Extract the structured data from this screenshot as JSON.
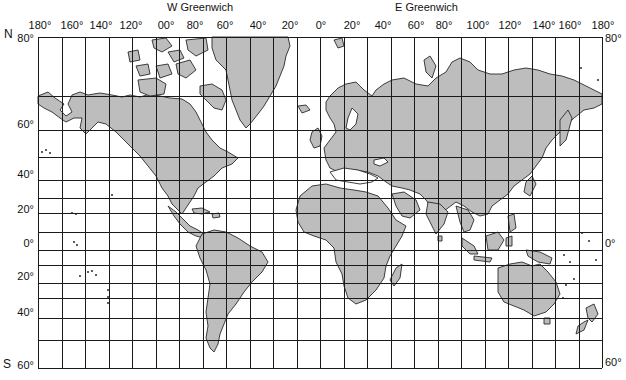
{
  "hemisphere_labels": {
    "west": "W Greenwich",
    "east": "E Greenwich"
  },
  "pole_labels": {
    "north": "N",
    "south": "S"
  },
  "longitude_labels_top": [
    {
      "text": "180°",
      "x": 40
    },
    {
      "text": "160°",
      "x": 72
    },
    {
      "text": "140°",
      "x": 101
    },
    {
      "text": "120°",
      "x": 131
    },
    {
      "text": "00°",
      "x": 166
    },
    {
      "text": "80°",
      "x": 195
    },
    {
      "text": "60°",
      "x": 225
    },
    {
      "text": "40°",
      "x": 258
    },
    {
      "text": "20°",
      "x": 290
    },
    {
      "text": "0°",
      "x": 321
    },
    {
      "text": "20°",
      "x": 352
    },
    {
      "text": "40°",
      "x": 383
    },
    {
      "text": "60°",
      "x": 416
    },
    {
      "text": "80°",
      "x": 444
    },
    {
      "text": "100°",
      "x": 478
    },
    {
      "text": "120°",
      "x": 510
    },
    {
      "text": "140°",
      "x": 544
    },
    {
      "text": "160°",
      "x": 570
    },
    {
      "text": "180°",
      "x": 603
    }
  ],
  "latitude_labels_left": [
    {
      "text": "80°",
      "y": 38
    },
    {
      "text": "60°",
      "y": 124
    },
    {
      "text": "40°",
      "y": 174
    },
    {
      "text": "20°",
      "y": 209
    },
    {
      "text": "0°",
      "y": 243
    },
    {
      "text": "20°",
      "y": 276
    },
    {
      "text": "40°",
      "y": 312
    },
    {
      "text": "60°",
      "y": 365
    }
  ],
  "latitude_labels_right": [
    {
      "text": "80°",
      "y": 38
    },
    {
      "text": "0°",
      "y": 243
    },
    {
      "text": "60°",
      "y": 362
    }
  ],
  "grid": {
    "left": 38,
    "right": 602,
    "top": 37,
    "bottom": 368,
    "columns": 24,
    "rows_y": [
      37,
      96,
      130,
      157,
      180,
      198,
      213,
      232,
      250,
      265,
      283,
      298,
      318,
      340,
      368
    ]
  },
  "colors": {
    "land": "#bdbdbd",
    "coast": "#2a2a2a",
    "grid": "#1a1a1a",
    "water": "#ffffff"
  }
}
